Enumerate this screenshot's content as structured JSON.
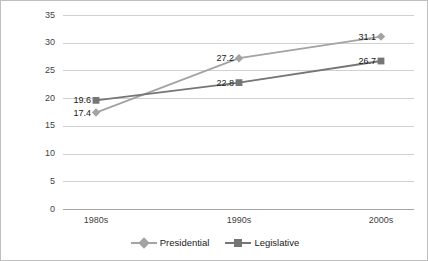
{
  "chart_data": {
    "type": "line",
    "title": "",
    "xlabel": "",
    "ylabel": "",
    "categories": [
      "1980s",
      "1990s",
      "2000s"
    ],
    "ylim": [
      0,
      35
    ],
    "yticks": [
      0,
      5,
      10,
      15,
      20,
      25,
      30,
      35
    ],
    "grid": true,
    "legend_position": "bottom",
    "series": [
      {
        "name": "Presidential",
        "marker": "diamond",
        "color": "#a3a3a3",
        "values": [
          17.4,
          27.2,
          31.1
        ],
        "labels": [
          "17.4",
          "27.2",
          "31.1"
        ]
      },
      {
        "name": "Legislative",
        "marker": "square",
        "color": "#767676",
        "values": [
          19.6,
          22.8,
          26.7
        ],
        "labels": [
          "19.6",
          "22.8",
          "26.7"
        ]
      }
    ]
  },
  "axes": {
    "ytick_labels": [
      "35",
      "30",
      "25",
      "20",
      "15",
      "10",
      "5",
      "0"
    ],
    "xtick_labels": [
      "1980s",
      "1990s",
      "2000s"
    ]
  },
  "legend": {
    "items": [
      {
        "label": "Presidential"
      },
      {
        "label": "Legislative"
      }
    ]
  },
  "colors": {
    "presidential": "#a3a3a3",
    "legislative": "#767676",
    "gridline": "#d0d0d0",
    "frame": "#bfbfbf",
    "text": "#3f3f3f"
  }
}
